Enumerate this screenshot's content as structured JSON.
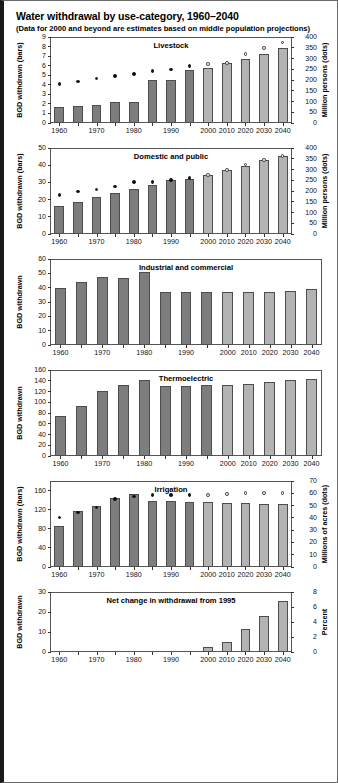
{
  "header": {
    "title": "Water withdrawal by use-category, 1960–2040",
    "subtitle": "(Data for 2000 and beyond are estimates based on middle population projections)"
  },
  "axis": {
    "years_all": [
      "1960",
      "1965",
      "1970",
      "1975",
      "1980",
      "1985",
      "1990",
      "1995",
      "2000",
      "2010",
      "2020",
      "2030",
      "2040"
    ],
    "xtick_labels": [
      "1960",
      "1970",
      "1980",
      "1990",
      "2000",
      "2010",
      "2020",
      "2030",
      "2040"
    ]
  },
  "chart_data": [
    {
      "id": "livestock",
      "type": "bar",
      "title": "Livestock",
      "xlabel": "",
      "ylabel": "BGD withdrawn (bars)",
      "y2label": "Million persons (dots)",
      "categories": [
        "1960",
        "1965",
        "1970",
        "1975",
        "1980",
        "1985",
        "1990",
        "1995",
        "2000",
        "2010",
        "2020",
        "2030",
        "2040"
      ],
      "values": [
        1.6,
        1.7,
        1.8,
        2.15,
        2.15,
        4.45,
        4.45,
        5.5,
        5.7,
        6.2,
        6.65,
        7.2,
        7.8
      ],
      "projected_from": "2000",
      "ylim": [
        0,
        9
      ],
      "yticks": [
        "0",
        "1",
        "2",
        "3",
        "4",
        "5",
        "6",
        "7",
        "8",
        "9"
      ],
      "y2lim": [
        0,
        400
      ],
      "y2ticks": [
        "0",
        "50",
        "100",
        "150",
        "200",
        "250",
        "300",
        "350",
        "400"
      ],
      "dots": {
        "name": "Population (million persons)",
        "values": [
          180,
          190,
          205,
          216,
          226,
          240,
          247,
          262,
          272,
          277,
          320,
          348,
          372
        ],
        "open_from": "2000"
      },
      "grid": false,
      "legend": "none"
    },
    {
      "id": "domestic-and-public",
      "type": "bar",
      "title": "Domestic and public",
      "xlabel": "",
      "ylabel": "BGD withdrawn (bars)",
      "y2label": "Million persons (dots)",
      "categories": [
        "1960",
        "1965",
        "1970",
        "1975",
        "1980",
        "1985",
        "1990",
        "1995",
        "2000",
        "2010",
        "2020",
        "2030",
        "2040"
      ],
      "values": [
        15.8,
        18.5,
        21.0,
        23.5,
        25.8,
        28.3,
        31.0,
        31.8,
        33.8,
        36.8,
        39.5,
        42.5,
        45.0
      ],
      "projected_from": "2000",
      "ylim": [
        0,
        50
      ],
      "yticks": [
        "0",
        "10",
        "20",
        "30",
        "40",
        "50"
      ],
      "y2lim": [
        0,
        400
      ],
      "y2ticks": [
        "0",
        "50",
        "100",
        "150",
        "200",
        "250",
        "300",
        "350",
        "400"
      ],
      "dots": {
        "name": "Population (million persons)",
        "values": [
          180,
          195,
          205,
          218,
          240,
          240,
          250,
          257,
          272,
          295,
          322,
          343,
          362
        ],
        "open_from": "2000"
      },
      "grid": false,
      "legend": "none"
    },
    {
      "id": "industrial-and-commercial",
      "type": "bar",
      "title": "Industrial and commercial",
      "xlabel": "",
      "ylabel": "BGD withdrawn",
      "y2label": "",
      "categories": [
        "1960",
        "1965",
        "1970",
        "1975",
        "1980",
        "1985",
        "1990",
        "1995",
        "2000",
        "2010",
        "2020",
        "2030",
        "2040"
      ],
      "values": [
        39.5,
        43.5,
        47.0,
        46.5,
        50.3,
        37.0,
        36.5,
        36.5,
        36.5,
        36.5,
        36.5,
        37.2,
        38.5
      ],
      "projected_from": "2000",
      "ylim": [
        0,
        60
      ],
      "yticks": [
        "0",
        "10",
        "20",
        "30",
        "40",
        "50",
        "60"
      ],
      "grid": false,
      "legend": "none"
    },
    {
      "id": "thermoelectric",
      "type": "bar",
      "title": "Thermoelectric",
      "xlabel": "",
      "ylabel": "BGD withdrawn",
      "y2label": "",
      "categories": [
        "1960",
        "1965",
        "1970",
        "1975",
        "1980",
        "1985",
        "1990",
        "1995",
        "2000",
        "2010",
        "2020",
        "2030",
        "2040"
      ],
      "values": [
        74,
        92,
        120,
        131,
        140,
        130,
        130,
        131,
        132,
        134,
        137,
        141,
        143
      ],
      "projected_from": "2000",
      "ylim": [
        0,
        160
      ],
      "yticks": [
        "0",
        "20",
        "40",
        "60",
        "80",
        "100",
        "120",
        "140",
        "160"
      ],
      "grid": false,
      "legend": "none"
    },
    {
      "id": "irrigation",
      "type": "bar",
      "title": "Irrigation",
      "xlabel": "",
      "ylabel": "BGD withdrawn (bars)",
      "y2label": "Millions of acres (dots)",
      "categories": [
        "1960",
        "1965",
        "1970",
        "1975",
        "1980",
        "1985",
        "1990",
        "1995",
        "2000",
        "2010",
        "2020",
        "2030",
        "2040"
      ],
      "values": [
        85,
        116,
        127,
        143,
        151,
        137,
        137,
        135,
        136,
        134,
        134,
        131,
        131
      ],
      "projected_from": "2000",
      "ylim": [
        0,
        180
      ],
      "yticks": [
        "0",
        "40",
        "80",
        "120",
        "160"
      ],
      "y2lim": [
        0,
        70
      ],
      "y2ticks": [
        "0",
        "10",
        "20",
        "30",
        "40",
        "50",
        "60",
        "70"
      ],
      "dots": {
        "name": "Irrigated area (millions of acres)",
        "values": [
          40,
          44,
          48,
          55,
          57,
          58,
          58,
          58,
          58,
          59,
          60,
          60,
          60
        ],
        "open_from": "2000"
      },
      "grid": false,
      "legend": "none"
    },
    {
      "id": "net-change",
      "type": "bar",
      "title": "Net change in withdrawal from 1995",
      "xlabel": "",
      "ylabel": "BGD withdrawn",
      "y2label": "Percent",
      "categories": [
        "1960",
        "1965",
        "1970",
        "1975",
        "1980",
        "1985",
        "1990",
        "1995",
        "2000",
        "2010",
        "2020",
        "2030",
        "2040"
      ],
      "values": [
        0,
        0,
        0,
        0,
        0,
        0,
        0,
        0,
        2.5,
        5.0,
        11.3,
        17.8,
        25.3
      ],
      "projected_from": "2000",
      "ylim": [
        0,
        30
      ],
      "yticks": [
        "0",
        "10",
        "20",
        "30"
      ],
      "y2lim": [
        0,
        8
      ],
      "y2ticks": [
        "0",
        "2",
        "4",
        "6",
        "8"
      ],
      "grid": false,
      "legend": "none"
    }
  ],
  "colors": {
    "bar_historical": "#7d7d7d",
    "bar_projected": "#b3b3b3",
    "dot_filled": "#111111",
    "dot_open": "#e8e8e8",
    "axis": "#555555"
  }
}
